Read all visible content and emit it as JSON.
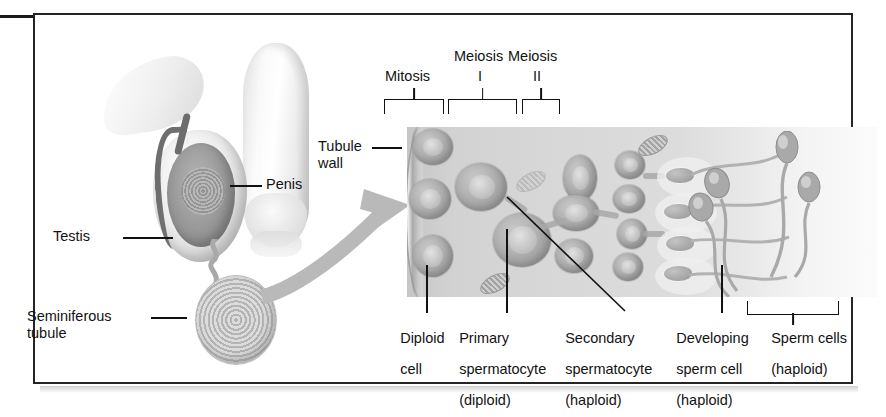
{
  "figure": {
    "border_color": "#242424",
    "background": "#ffffff"
  },
  "anatomy_labels": [
    {
      "id": "penis",
      "text": "Penis"
    },
    {
      "id": "testis",
      "text": "Testis"
    },
    {
      "id": "seminiferous",
      "text": "Seminiferous\ntubule",
      "line1": "Seminiferous",
      "line2": "tubule"
    },
    {
      "id": "tubule-wall",
      "text": "Tubule\nwall",
      "line1": "Tubule",
      "line2": "wall"
    }
  ],
  "stage_brackets": [
    {
      "id": "mitosis",
      "label": "Mitosis",
      "line1": "Mitosis",
      "line2": ""
    },
    {
      "id": "meiosis-1",
      "label": "Meiosis I",
      "line1": "Meiosis",
      "line2": "I"
    },
    {
      "id": "meiosis-2",
      "label": "Meiosis II",
      "line1": "Meiosis",
      "line2": "II"
    }
  ],
  "cell_labels": [
    {
      "id": "diploid-cell",
      "line1": "Diploid",
      "line2": "cell",
      "line3": ""
    },
    {
      "id": "primary-spermatocyte",
      "line1": "Primary",
      "line2": "spermatocyte",
      "line3": "(diploid)"
    },
    {
      "id": "secondary-spermatocyte",
      "line1": "Secondary",
      "line2": "spermatocyte",
      "line3": "(haploid)"
    },
    {
      "id": "developing-sperm-cell",
      "line1": "Developing",
      "line2": "sperm cell",
      "line3": "(haploid)"
    },
    {
      "id": "sperm-cells",
      "line1": "Sperm cells",
      "line2": "(haploid)",
      "line3": ""
    }
  ],
  "colors": {
    "ink": "#121212",
    "tubule_light": "#dcdcdc",
    "tubule_dark": "#c6c6c6",
    "cell_fill": "#b0b0b0",
    "arrow_gray": "#b9b9b9"
  }
}
